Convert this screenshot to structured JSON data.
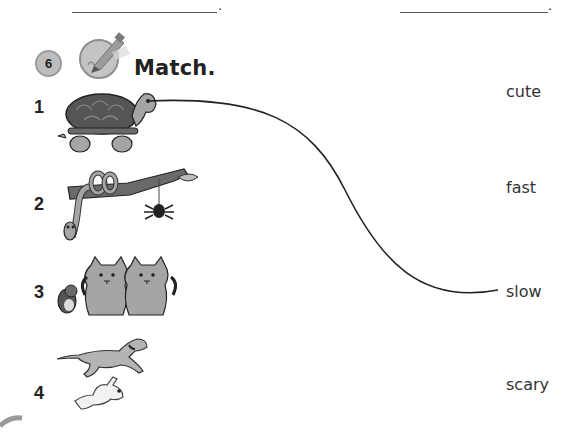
{
  "header": {
    "blank_lines": [
      {
        "left": 72,
        "width": 145,
        "top": 12,
        "period": "."
      },
      {
        "left": 400,
        "width": 148,
        "top": 12,
        "period": "."
      }
    ]
  },
  "exercise": {
    "number": "6",
    "icon": "pencil-writing-icon",
    "instruction": "Match."
  },
  "items": [
    {
      "number": "1",
      "picture": "turtle-picture",
      "description": "tortoise"
    },
    {
      "number": "2",
      "picture": "snake-and-spider-picture",
      "description": "snake on branch and spider"
    },
    {
      "number": "3",
      "picture": "hamster-and-kittens-picture",
      "description": "hamster and two kittens"
    },
    {
      "number": "4",
      "picture": "dog-and-rabbit-picture",
      "description": "running dog and rabbit"
    }
  ],
  "words": [
    "cute",
    "fast",
    "slow",
    "scary"
  ],
  "matches": [
    {
      "from_item": "1",
      "to_word": "slow",
      "line_color": "#222222"
    }
  ]
}
